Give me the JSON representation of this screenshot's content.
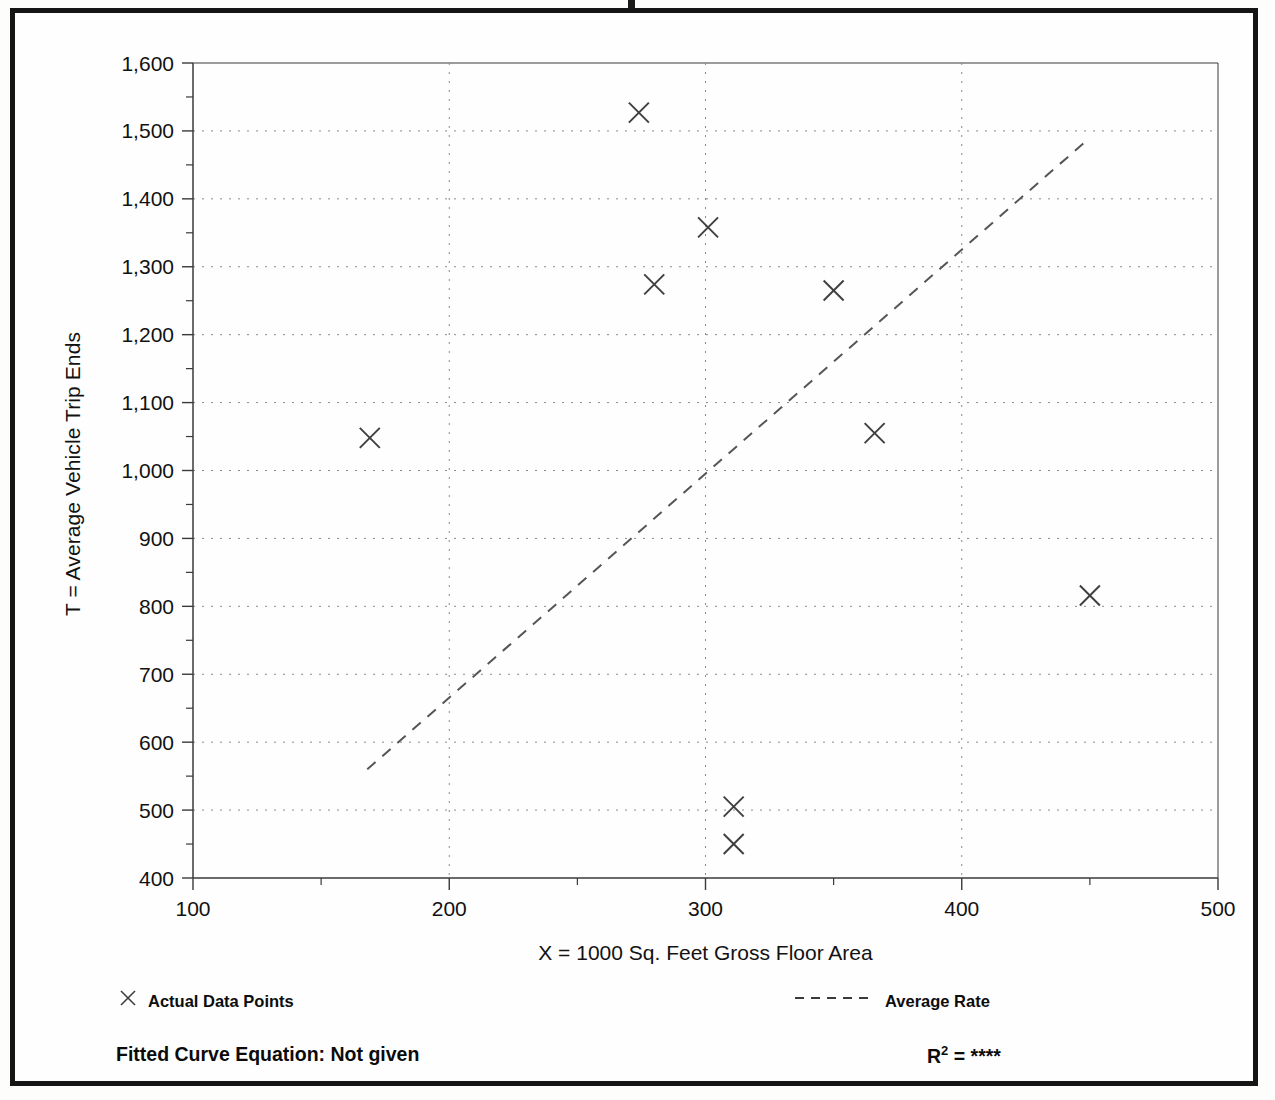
{
  "figure": {
    "y_axis_title": "T = Average Vehicle Trip Ends",
    "x_axis_title": "X = 1000 Sq. Feet Gross Floor Area"
  },
  "legend": {
    "data_points_label": "Actual Data Points",
    "data_points_marker": "x-marker-icon",
    "average_rate_label": "Average Rate",
    "average_rate_marker": "dashed-line-icon"
  },
  "footer": {
    "fitted_equation": "Fitted Curve Equation:  Not given",
    "r_squared_base": "R",
    "r_squared_exp": "2",
    "r_squared_value": " = ****"
  },
  "colors": {
    "frame": "#151515",
    "axis": "#3a3a3a",
    "grid": "#8a8a8a",
    "marker": "#3f3f3f",
    "trend": "#555555",
    "text": "#111111"
  },
  "chart_data": {
    "type": "scatter",
    "title": "",
    "xlabel": "X = 1000 Sq. Feet Gross Floor Area",
    "ylabel": "T = Average Vehicle Trip Ends",
    "xlim": [
      100,
      500
    ],
    "ylim": [
      400,
      1600
    ],
    "x_ticks": [
      100,
      200,
      300,
      400,
      500
    ],
    "x_tick_labels": [
      "100",
      "200",
      "300",
      "400",
      "500"
    ],
    "x_minor_ticks": [
      150,
      250,
      350,
      450
    ],
    "y_ticks": [
      400,
      500,
      600,
      700,
      800,
      900,
      1000,
      1100,
      1200,
      1300,
      1400,
      1500,
      1600
    ],
    "y_tick_labels": [
      "400",
      "500",
      "600",
      "700",
      "800",
      "900",
      "1,000",
      "1,100",
      "1,200",
      "1,300",
      "1,400",
      "1,500",
      "1,600"
    ],
    "y_minor_ticks": [
      450,
      550,
      650,
      750,
      850,
      950,
      1050,
      1150,
      1250,
      1350,
      1450,
      1550
    ],
    "grid": true,
    "grid_style": "dotted",
    "legend_position": "below-plot",
    "series": [
      {
        "name": "Actual Data Points",
        "marker": "x",
        "points": [
          {
            "x": 169,
            "y": 1048
          },
          {
            "x": 274,
            "y": 1527
          },
          {
            "x": 280,
            "y": 1274
          },
          {
            "x": 301,
            "y": 1358
          },
          {
            "x": 311,
            "y": 505
          },
          {
            "x": 311,
            "y": 450
          },
          {
            "x": 350,
            "y": 1265
          },
          {
            "x": 366,
            "y": 1055
          },
          {
            "x": 450,
            "y": 816
          }
        ]
      },
      {
        "name": "Average Rate",
        "type": "line",
        "style": "dashed",
        "endpoints": [
          {
            "x": 168,
            "y": 560
          },
          {
            "x": 450,
            "y": 1490
          }
        ]
      }
    ]
  }
}
